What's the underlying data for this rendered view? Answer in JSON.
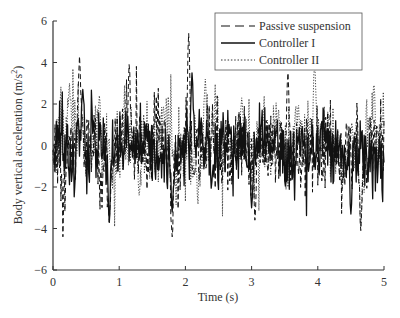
{
  "chart_data": {
    "type": "line",
    "title": "",
    "xlabel": "Time (s)",
    "ylabel": "Body vertical acceleration (m/s²)",
    "ylabel_parts": {
      "main": "Body vertical acceleration (m/s",
      "sup": "2",
      "close": ")"
    },
    "xlim": [
      0,
      5
    ],
    "ylim": [
      -6,
      6
    ],
    "xticks": [
      0,
      1,
      2,
      3,
      4,
      5
    ],
    "xtick_labels": [
      "0",
      "1",
      "2",
      "3",
      "4",
      "5"
    ],
    "yticks": [
      -6,
      -4,
      -2,
      0,
      2,
      4,
      6
    ],
    "ytick_labels": [
      "−6",
      "−4",
      "−2",
      "0",
      "2",
      "4",
      "6"
    ],
    "grid": false,
    "legend_position": "upper right",
    "series": [
      {
        "name": "Passive suspension",
        "style": "dashed",
        "color": "#111111",
        "approx_range": [
          -4.4,
          5.4
        ],
        "rms_estimate": 1.5,
        "notable_points": [
          {
            "x": 0.4,
            "y": 4.3
          },
          {
            "x": 0.85,
            "y": -3.7
          },
          {
            "x": 1.15,
            "y": 3.9
          },
          {
            "x": 1.8,
            "y": -4.4
          },
          {
            "x": 2.05,
            "y": 5.4
          },
          {
            "x": 3.05,
            "y": -3.6
          },
          {
            "x": 3.55,
            "y": 3.5
          },
          {
            "x": 4.65,
            "y": -4.1
          }
        ]
      },
      {
        "name": "Controller I",
        "style": "solid",
        "color": "#111111",
        "approx_range": [
          -3.7,
          3.5
        ],
        "rms_estimate": 1.2,
        "notable_points": [
          {
            "x": 0.45,
            "y": 2.7
          },
          {
            "x": 0.85,
            "y": -3.7
          },
          {
            "x": 1.8,
            "y": -3.2
          },
          {
            "x": 2.1,
            "y": 3.5
          },
          {
            "x": 3.0,
            "y": -3.0
          },
          {
            "x": 4.5,
            "y": -3.3
          }
        ]
      },
      {
        "name": "Controller II",
        "style": "dotted",
        "color": "#333333",
        "approx_range": [
          -3.9,
          3.8
        ],
        "rms_estimate": 1.4,
        "notable_points": [
          {
            "x": 0.25,
            "y": 3.0
          },
          {
            "x": 0.7,
            "y": 2.4
          },
          {
            "x": 1.3,
            "y": -2.4
          },
          {
            "x": 2.3,
            "y": 3.2
          },
          {
            "x": 2.85,
            "y": 2.3
          },
          {
            "x": 3.95,
            "y": 3.8
          },
          {
            "x": 4.65,
            "y": -3.9
          },
          {
            "x": 4.85,
            "y": 2.9
          }
        ]
      }
    ],
    "samples": 500
  },
  "legend": {
    "items": [
      {
        "label": "Passive suspension",
        "style": "dashed"
      },
      {
        "label": "Controller I",
        "style": "solid"
      },
      {
        "label": "Controller II",
        "style": "dotted"
      }
    ]
  }
}
